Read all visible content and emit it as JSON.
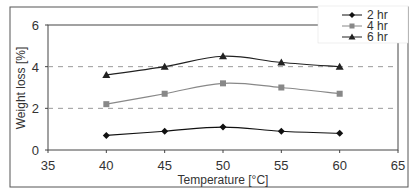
{
  "chart_data": {
    "type": "line",
    "title": "",
    "xlabel": "Temperature [°C]",
    "ylabel": "Weight loss [%]",
    "x": [
      40,
      45,
      50,
      55,
      60
    ],
    "xlim": [
      35,
      65
    ],
    "ylim": [
      0,
      6
    ],
    "xticks": [
      "35",
      "40",
      "45",
      "50",
      "55",
      "60",
      "65"
    ],
    "yticks": [
      "0",
      "2",
      "4",
      "6"
    ],
    "grid": {
      "horizontal_dashed_at": [
        2,
        4
      ]
    },
    "legend_position": "top-right",
    "series": [
      {
        "name": "2 hr",
        "marker": "diamond",
        "color": "#111111",
        "values": [
          0.7,
          0.9,
          1.1,
          0.9,
          0.8
        ]
      },
      {
        "name": "4 hr",
        "marker": "square",
        "color": "#888888",
        "values": [
          2.2,
          2.7,
          3.2,
          3.0,
          2.7
        ]
      },
      {
        "name": "6 hr",
        "marker": "triangle",
        "color": "#222222",
        "values": [
          3.6,
          4.0,
          4.5,
          4.2,
          4.0
        ]
      }
    ]
  },
  "legend": {
    "items": [
      "2 hr",
      "4 hr",
      "6 hr"
    ]
  },
  "axes": {
    "x_title": "Temperature [°C]",
    "y_title": "Weight loss [%]"
  }
}
